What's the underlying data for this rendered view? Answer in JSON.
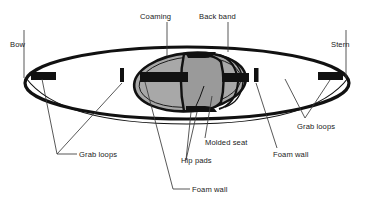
{
  "figure": {
    "view": "top view",
    "background_color": "#ffffff",
    "line_color": "#111111",
    "hull_fill": "#ffffff",
    "coaming_fill": "#a8a8a8",
    "seat_fill": "#9a9a9a",
    "hardware_fill": "#111111"
  },
  "labels": {
    "bow": "Bow",
    "stern": "Stern",
    "coaming": "Coaming",
    "back_band": "Back band",
    "grab_loops_left": "Grab loops",
    "grab_loops_right": "Grab loops",
    "hip_pads": "Hip pads",
    "molded_seat": "Molded seat",
    "foam_wall_left": "Foam wall",
    "foam_wall_right": "Foam wall"
  },
  "parts": [
    {
      "id": "bow",
      "label": "Bow",
      "side": "left",
      "description": "front tip of hull"
    },
    {
      "id": "stern",
      "label": "Stern",
      "side": "right",
      "description": "rear tip of hull"
    },
    {
      "id": "coaming",
      "label": "Coaming",
      "side": "center",
      "description": "raised rim around cockpit opening"
    },
    {
      "id": "back-band",
      "label": "Back band",
      "side": "center",
      "description": "lumbar support strap behind seat"
    },
    {
      "id": "molded-seat",
      "label": "Molded seat",
      "side": "center",
      "description": "contoured seat pan"
    },
    {
      "id": "hip-pads",
      "label": "Hip pads",
      "side": "center",
      "description": "padding at the hips"
    },
    {
      "id": "foam-wall-front",
      "label": "Foam wall",
      "side": "left",
      "description": "bulkhead foam wall forward of cockpit"
    },
    {
      "id": "foam-wall-rear",
      "label": "Foam wall",
      "side": "right",
      "description": "bulkhead foam wall aft of cockpit"
    },
    {
      "id": "grab-loops-bow",
      "label": "Grab loops",
      "side": "left",
      "description": "carry handles near bow"
    },
    {
      "id": "grab-loops-stern",
      "label": "Grab loops",
      "side": "right",
      "description": "carry handles near stern"
    }
  ]
}
